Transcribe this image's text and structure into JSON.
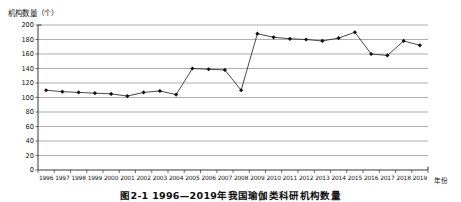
{
  "figure": {
    "caption": "图2-1  1996—2019年我国瑜伽类科研机构数量",
    "y_axis_title": "机构数量（个）",
    "x_axis_title": "年份"
  },
  "chart_data": {
    "type": "line",
    "title": "图2-1  1996—2019年我国瑜伽类科研机构数量",
    "xlabel": "年份",
    "ylabel": "机构数量（个）",
    "ylim": [
      0,
      200
    ],
    "ytick_values": [
      0,
      20,
      40,
      60,
      80,
      100,
      120,
      140,
      160,
      180,
      200
    ],
    "ytick_labels": [
      "0",
      "20",
      "40",
      "60",
      "80",
      "100",
      "120",
      "140",
      "160",
      "180",
      "200"
    ],
    "grid": "horizontal",
    "legend": "none",
    "marker": "filled-diamond",
    "line_color": "#1a1a1a",
    "grid_color": "#8c8c8c",
    "categories": [
      "1996",
      "1997",
      "1998",
      "1999",
      "2000",
      "2001",
      "2002",
      "2003",
      "2004",
      "2005",
      "2006",
      "2007",
      "2008",
      "2009",
      "2010",
      "2011",
      "2012",
      "2013",
      "2014",
      "2015",
      "2016",
      "2017",
      "2018",
      "2019"
    ],
    "values": [
      110,
      108,
      107,
      106,
      105,
      102,
      107,
      109,
      104,
      140,
      139,
      138,
      110,
      188,
      183,
      181,
      180,
      178,
      182,
      190,
      160,
      158,
      178,
      172
    ]
  }
}
